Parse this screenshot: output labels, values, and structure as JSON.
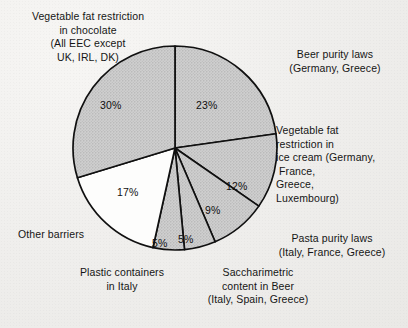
{
  "chart_data": {
    "type": "pie",
    "title": "",
    "subtitle": "",
    "xlabel": "",
    "ylabel": "",
    "legend_position": "callout-labels",
    "grid": false,
    "units": "percent",
    "start_angle_deg": 0,
    "direction": "clockwise",
    "categories": [
      "Beer purity laws (Germany, Greece)",
      "Vegetable fat restriction in ice cream (Germany, France, Greece, Luxembourg)",
      "Pasta purity laws (Italy, France, Greece)",
      "Saccharimetric content in Beer (Italy, Spain, Greece)",
      "Plastic containers in Italy",
      "Other barriers",
      "Vegetable fat restriction in chocolate (All EEC except UK, IRL, DK)"
    ],
    "values": [
      23,
      12,
      9,
      5,
      5,
      17,
      30
    ],
    "slices": [
      {
        "key": "beer",
        "value": 23,
        "value_label": "23%",
        "fill": "#c9c9c9",
        "stroke": "#101010"
      },
      {
        "key": "icecream",
        "value": 12,
        "value_label": "12%",
        "fill": "#c9c9c9",
        "stroke": "#101010"
      },
      {
        "key": "pasta",
        "value": 9,
        "value_label": "9%",
        "fill": "#c9c9c9",
        "stroke": "#101010"
      },
      {
        "key": "sacch",
        "value": 5,
        "value_label": "5%",
        "fill": "#c9c9c9",
        "stroke": "#101010"
      },
      {
        "key": "plastic",
        "value": 5,
        "value_label": "5%",
        "fill": "#c9c9c9",
        "stroke": "#101010"
      },
      {
        "key": "other",
        "value": 17,
        "value_label": "17%",
        "fill": "#ffffff",
        "stroke": "#101010"
      },
      {
        "key": "chocolate",
        "value": 30,
        "value_label": "30%",
        "fill": "#c9c9c9",
        "stroke": "#101010"
      }
    ]
  },
  "percent_labels": {
    "chocolate": "30%",
    "beer": "23%",
    "icecream": "12%",
    "pasta": "9%",
    "sacch": "5%",
    "plastic": "5%",
    "other": "17%"
  },
  "callouts": {
    "chocolate": "Vegetable fat restriction\nin chocolate\n(All EEC except\nUK, IRL, DK)",
    "beer": "Beer purity laws\n(Germany, Greece)",
    "icecream": "Vegetable fat\nrestriction in\nice cream (Germany,\n France,\nGreece,\nLuxembourg)",
    "pasta": "Pasta purity laws\n(Italy, France, Greece)",
    "sacch": "Saccharimetric\ncontent in Beer\n(Italy, Spain, Greece)",
    "plastic": "Plastic containers\nin Italy",
    "other": "Other barriers"
  },
  "colors": {
    "slice_fill": "#c9c9c9",
    "slice_fill_highlight": "#ffffff",
    "slice_stroke": "#101010",
    "page_background": "#f0efed",
    "text": "#151515"
  }
}
